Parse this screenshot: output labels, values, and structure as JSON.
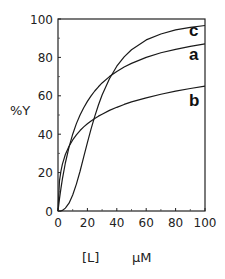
{
  "chart_data": {
    "type": "line",
    "title": "",
    "xlabel": "[L]   µM",
    "xlabel_left": "[L]",
    "xlabel_unit": "µM",
    "ylabel": "%Y",
    "xlim": [
      0,
      100
    ],
    "ylim": [
      0,
      100
    ],
    "x_ticks": [
      0,
      20,
      40,
      60,
      80,
      100
    ],
    "y_ticks": [
      0,
      20,
      40,
      60,
      80,
      100
    ],
    "grid": false,
    "legend": "inline labels at right end of curves",
    "x": [
      0,
      1,
      2,
      3,
      5,
      7.5,
      10,
      12.5,
      15,
      17.5,
      20,
      22.5,
      25,
      27.5,
      30,
      35,
      40,
      45,
      50,
      60,
      70,
      80,
      90,
      100
    ],
    "series": [
      {
        "name": "a",
        "values": [
          0,
          6.3,
          11.8,
          16.7,
          25.0,
          33.3,
          40.0,
          45.5,
          50.0,
          53.8,
          57.1,
          60.0,
          62.5,
          64.7,
          66.7,
          70.0,
          72.7,
          75.0,
          76.9,
          80.0,
          82.4,
          84.2,
          85.7,
          87.0
        ]
      },
      {
        "name": "b",
        "values": [
          0,
          15.7,
          20.8,
          24.4,
          29.4,
          33.7,
          37.0,
          39.7,
          41.9,
          43.8,
          45.4,
          46.9,
          48.2,
          49.4,
          50.4,
          52.4,
          54.0,
          55.5,
          56.8,
          58.9,
          60.8,
          62.4,
          63.8,
          65.0
        ]
      },
      {
        "name": "c",
        "values": [
          0,
          0.0,
          0.1,
          0.3,
          1.5,
          4.1,
          8.3,
          14.0,
          20.7,
          28.2,
          35.6,
          42.8,
          49.3,
          55.2,
          60.4,
          68.9,
          75.4,
          80.3,
          84.0,
          89.1,
          92.2,
          94.3,
          95.6,
          96.6
        ]
      }
    ]
  },
  "labels": {
    "y_axis": "%Y",
    "x_axis_var": "[L]",
    "x_axis_unit": "µM",
    "series": [
      "a",
      "b",
      "c"
    ]
  }
}
